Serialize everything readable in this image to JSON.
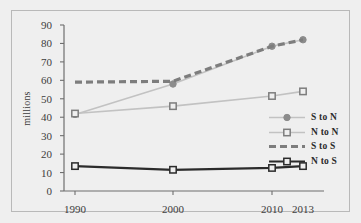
{
  "chart_data": {
    "type": "line",
    "title": "",
    "subtitle": "",
    "xlabel": "",
    "ylabel": "millions",
    "x": [
      "1990",
      "2000",
      "2010",
      "2013"
    ],
    "x_positions": [
      63,
      161,
      260,
      291
    ],
    "ylim": [
      0,
      90
    ],
    "yticks": [
      0,
      10,
      20,
      30,
      40,
      50,
      60,
      70,
      80,
      90
    ],
    "ytick_labels": [
      "0",
      "10",
      "20",
      "30",
      "40",
      "50",
      "60",
      "70",
      "80",
      "90"
    ],
    "grid": false,
    "legend_position": "center-right",
    "series": [
      {
        "name": "S to N",
        "values": [
          41.5,
          58.0,
          78.5,
          82.0
        ],
        "color": "#c2c2c2",
        "marker": "circle",
        "marker_color": "#8c8c8c",
        "dash": "none",
        "width": 1.6
      },
      {
        "name": "N to N",
        "values": [
          42.0,
          46.0,
          51.5,
          54.0
        ],
        "color": "#c2c2c2",
        "marker": "square",
        "marker_color": "#7d7d7d",
        "dash": "none",
        "width": 1.6
      },
      {
        "name": "S to S",
        "values": [
          59.0,
          59.5,
          78.5,
          82.0
        ],
        "color": "#7d7d7d",
        "marker": "none",
        "marker_color": "#7d7d7d",
        "dash": "dashed",
        "width": 3.2
      },
      {
        "name": "N to S",
        "values": [
          13.5,
          11.5,
          12.5,
          13.5
        ],
        "color": "#2b2b2b",
        "marker": "square",
        "marker_color": "#2b2b2b",
        "dash": "none",
        "width": 2.2
      }
    ],
    "axis_color": "#6e6e6e",
    "background": "#efefef",
    "frame_color": "#b9b9b9"
  },
  "legend": {
    "items": [
      {
        "label": "S to N"
      },
      {
        "label": "N to N"
      },
      {
        "label": "S to S"
      },
      {
        "label": "N to S"
      }
    ]
  }
}
